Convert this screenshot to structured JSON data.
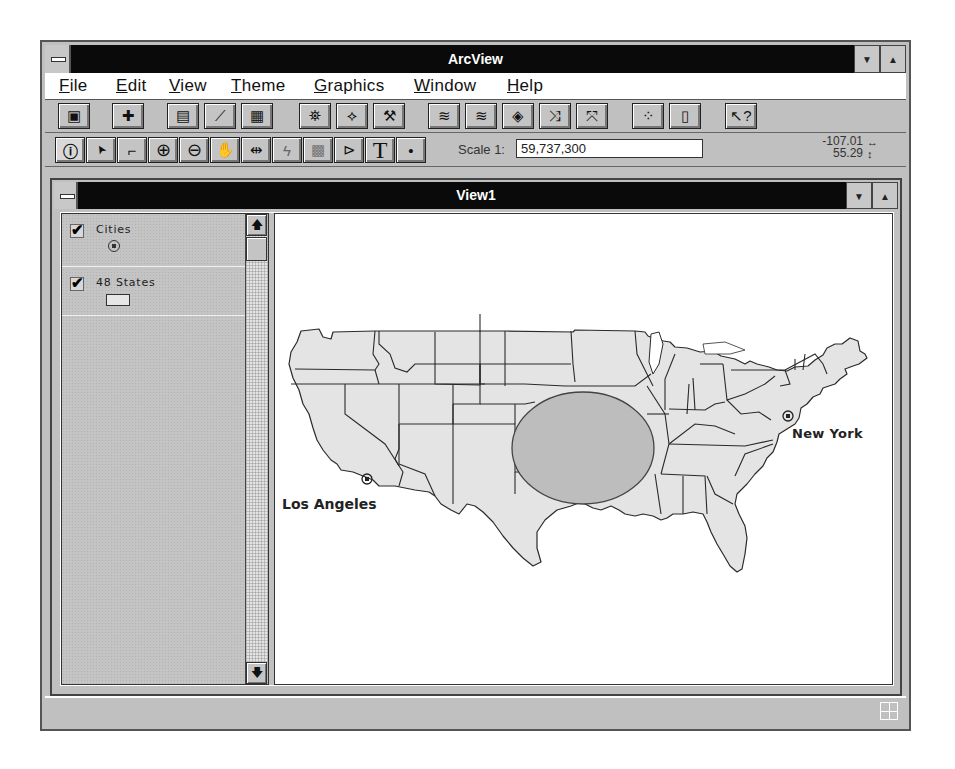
{
  "app": {
    "title": "ArcView",
    "window_buttons": {
      "minimize": "▼",
      "maximize": "▲"
    }
  },
  "menu": [
    {
      "label": "File",
      "accel": "F",
      "rest": "ile"
    },
    {
      "label": "Edit",
      "accel": "E",
      "rest": "dit"
    },
    {
      "label": "View",
      "accel": "V",
      "rest": "iew"
    },
    {
      "label": "Theme",
      "accel": "T",
      "rest": "heme"
    },
    {
      "label": "Graphics",
      "accel": "G",
      "rest": "raphics"
    },
    {
      "label": "Window",
      "accel": "W",
      "rest": "indow"
    },
    {
      "label": "Help",
      "accel": "H",
      "rest": "elp"
    }
  ],
  "toolbar_buttons": [
    {
      "name": "save-project",
      "icon": "floppy-disk-icon",
      "glyph": "▣"
    },
    {
      "name": "add-theme",
      "icon": "add-theme-icon",
      "glyph": "✚"
    },
    {
      "name": "theme-properties",
      "icon": "theme-properties-icon",
      "glyph": "▤"
    },
    {
      "name": "edit-legend",
      "icon": "edit-legend-icon",
      "glyph": "⟋"
    },
    {
      "name": "open-theme-table",
      "icon": "table-icon",
      "glyph": "▦"
    },
    {
      "name": "find",
      "icon": "binoculars-icon",
      "glyph": "⛯"
    },
    {
      "name": "locate-address",
      "icon": "locate-icon",
      "glyph": "⟡"
    },
    {
      "name": "query-builder",
      "icon": "hammer-question-icon",
      "glyph": "⚒"
    },
    {
      "name": "zoom-to-full-extent",
      "icon": "layers-icon",
      "glyph": "≋"
    },
    {
      "name": "zoom-to-themes",
      "icon": "layers-down-icon",
      "glyph": "≋"
    },
    {
      "name": "zoom-to-selected",
      "icon": "diamond-arrow-icon",
      "glyph": "◈"
    },
    {
      "name": "zoom-in-fixed",
      "icon": "arrows-inward-icon",
      "glyph": "⤨"
    },
    {
      "name": "zoom-out-fixed",
      "icon": "arrows-outward-icon",
      "glyph": "⤧"
    },
    {
      "name": "select-features-graphic",
      "icon": "select-graphic-icon",
      "glyph": "⁘"
    },
    {
      "name": "clear-selected",
      "icon": "clear-selection-icon",
      "glyph": "▯"
    },
    {
      "name": "help",
      "icon": "help-pointer-icon",
      "glyph": "↖?"
    }
  ],
  "tools": [
    {
      "name": "identify",
      "icon": "info-icon",
      "glyph": "ⓘ"
    },
    {
      "name": "pointer",
      "icon": "arrow-pointer-icon",
      "glyph": "➤"
    },
    {
      "name": "vertex-edit",
      "icon": "vertex-icon",
      "glyph": "⌐"
    },
    {
      "name": "zoom-in",
      "icon": "zoom-in-icon",
      "glyph": "⊕"
    },
    {
      "name": "zoom-out",
      "icon": "zoom-out-icon",
      "glyph": "⊖"
    },
    {
      "name": "pan",
      "icon": "hand-icon",
      "glyph": "✋"
    },
    {
      "name": "measure",
      "icon": "measure-icon",
      "glyph": "⇹"
    },
    {
      "name": "hot-link",
      "icon": "lightning-icon",
      "glyph": "ϟ"
    },
    {
      "name": "select-feature",
      "icon": "select-feature-icon",
      "glyph": "▩"
    },
    {
      "name": "label",
      "icon": "label-tag-icon",
      "glyph": "⊳"
    },
    {
      "name": "text",
      "icon": "text-icon",
      "glyph": "T"
    },
    {
      "name": "draw-point",
      "icon": "point-icon",
      "glyph": "•"
    }
  ],
  "scale": {
    "label": "Scale 1:",
    "value": "59,737,300"
  },
  "coordinates": {
    "x": "-107.01",
    "y": "55.29",
    "x_icon": "↔",
    "y_icon": "↕"
  },
  "view": {
    "title": "View1",
    "themes": [
      {
        "name": "Cities",
        "checked": true,
        "symbol": "point"
      },
      {
        "name": "48 States",
        "checked": true,
        "symbol": "polygon"
      }
    ],
    "labels": [
      {
        "text": "Los Angeles",
        "x": 7,
        "y": 296
      },
      {
        "text": "New York",
        "x": 517,
        "y": 226
      }
    ],
    "selection_ellipse": {
      "cx": 308,
      "cy": 234,
      "rx": 71,
      "ry": 56
    },
    "colors": {
      "state_fill": "#e4e4e4",
      "state_outline": "#2a2a2a",
      "ellipse_fill": "#bdbdbd"
    }
  }
}
